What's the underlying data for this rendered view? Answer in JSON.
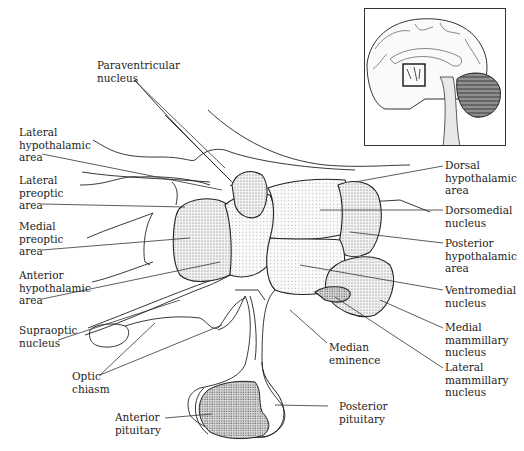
{
  "figure": {
    "inset": {
      "description": "Midsagittal brain with boxed region indicating hypothalamus",
      "icon": "brain-inset-icon"
    },
    "labels": {
      "paraventricular": "Paraventricular\nnucleus",
      "lateral_hypothalamic": "Lateral\nhypothalamic\narea",
      "lateral_preoptic": "Lateral\npreoptic\narea",
      "medial_preoptic": "Medial\npreoptic\narea",
      "anterior_hypothalamic": "Anterior\nhypothalamic\narea",
      "supraoptic": "Supraoptic\nnucleus",
      "optic_chiasm": "Optic\nchiasm",
      "anterior_pituitary": "Anterior\npituitary",
      "posterior_pituitary": "Posterior\npituitary",
      "median_eminence": "Median\neminence",
      "dorsal_hypothalamic": "Dorsal\nhypothalamic\narea",
      "dorsomedial": "Dorsomedial\nnucleus",
      "posterior_hypothalamic": "Posterior\nhypothalamic\narea",
      "ventromedial": "Ventromedial\nnucleus",
      "medial_mammillary": "Medial\nmammillary\nnucleus",
      "lateral_mammillary": "Lateral\nmammillary\nnucleus"
    },
    "colors": {
      "ink": "#1a1a1a",
      "stipple": "#9a9a9a",
      "background": "#ffffff"
    }
  }
}
